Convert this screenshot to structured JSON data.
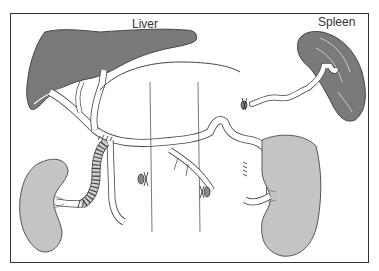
{
  "diagram": {
    "labels": {
      "liver": "Liver",
      "spleen": "Spleen"
    },
    "organs": [
      {
        "name": "liver",
        "fill": "#7a7a7a"
      },
      {
        "name": "spleen",
        "fill": "#7a7a7a"
      },
      {
        "name": "left-kidney",
        "fill": "#c4c4c4"
      },
      {
        "name": "right-kidney",
        "fill": "#c4c4c4"
      }
    ],
    "colors": {
      "frame": "#333333",
      "outline": "#444444",
      "dark_organ": "#7a7a7a",
      "light_organ": "#c4c4c4",
      "vessel_fill": "#ffffff",
      "graft": "#d0d0d0"
    }
  }
}
